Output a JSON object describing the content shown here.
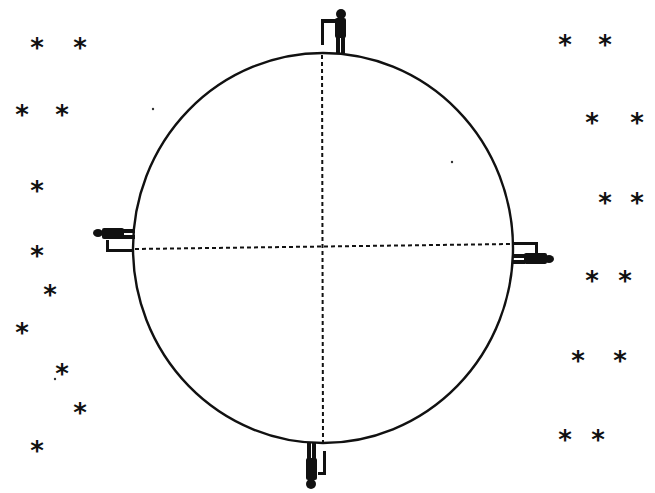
{
  "diagram": {
    "colors": {
      "ink": "#111111",
      "background": "#ffffff"
    },
    "earth": {
      "name": "earth-circle",
      "axes": [
        "horizontal-dashed-axis",
        "vertical-dashed-axis"
      ]
    },
    "people": [
      {
        "position": "top",
        "orientation": "upright"
      },
      {
        "position": "left",
        "orientation": "horizontal-facing-left"
      },
      {
        "position": "right",
        "orientation": "horizontal-facing-right"
      },
      {
        "position": "bottom",
        "orientation": "upside-down"
      }
    ],
    "star_glyph": "*",
    "stars_left_count": 12,
    "stars_right_count": 12
  }
}
